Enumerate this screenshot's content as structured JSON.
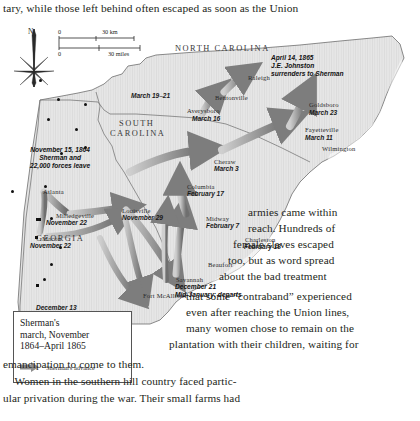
{
  "page": {
    "top_text": "tary, while those left behind often escaped as soon as the Union"
  },
  "body_text": {
    "wrapped_lines": [
      "armies came within",
      "reach. Hundreds of",
      "female slaves escaped",
      "too, but as word spread",
      "about the bad treatment",
      "that some “contraband” experienced",
      "even after reaching the Union lines,",
      "many women chose to remain on the",
      "plantation with their children, waiting for"
    ],
    "full_lines": [
      "emancipation to come to them.",
      "    Women in the southern hill country faced partic-",
      "ular privation during the war. Their small farms had"
    ]
  },
  "map": {
    "compass": {
      "north_letter": "N",
      "icon": "compass-rose-icon"
    },
    "scale": {
      "km_zero": "0",
      "km_label": "30 km",
      "miles_zero": "0",
      "miles_label": "30 miles"
    },
    "states": [
      {
        "name": "NORTH CAROLINA",
        "x": 175,
        "y": 22
      },
      {
        "name": "SOUTH",
        "x": 119,
        "y": 97
      },
      {
        "name": "CAROLINA",
        "x": 110,
        "y": 107
      },
      {
        "name": "GEORGIA",
        "x": 36,
        "y": 212
      }
    ],
    "cities": [
      {
        "label": "Raleigh",
        "x": 248,
        "y": 52,
        "dx": 39,
        "dy": 57,
        "shape": "dot"
      },
      {
        "label": "Bentonville",
        "x": 215,
        "y": 72,
        "dx": 57,
        "dy": 76,
        "shape": "dot"
      },
      {
        "label": "Averysboro",
        "x": 187,
        "y": 85,
        "dx": 47,
        "dy": 96,
        "shape": "dot"
      },
      {
        "label": "Goldsboro",
        "x": 309,
        "y": 79,
        "dx": 84,
        "dy": 81,
        "shape": "dot"
      },
      {
        "label": "Fayetteville",
        "x": 305,
        "y": 104,
        "dx": 75,
        "dy": 106,
        "shape": "dot"
      },
      {
        "label": "Wilmington",
        "x": 322,
        "y": 123,
        "dx": 84,
        "dy": 124,
        "shape": "dot"
      },
      {
        "label": "Cheraw",
        "x": 214,
        "y": 136,
        "dx": 60,
        "dy": 130,
        "shape": "dot"
      },
      {
        "label": "Columbia",
        "x": 187,
        "y": 161,
        "dx": 44,
        "dy": 163,
        "shape": "dot"
      },
      {
        "label": "Louisville",
        "x": 122,
        "y": 185,
        "dx": 36,
        "dy": 196,
        "shape": "square"
      },
      {
        "label": "Midway",
        "x": 206,
        "y": 193,
        "dx": 50,
        "dy": 195,
        "shape": "dot"
      },
      {
        "label": "Charleston",
        "x": 245,
        "y": 214,
        "dx": 59,
        "dy": 224,
        "shape": "dot"
      },
      {
        "label": "Beaufort",
        "x": 208,
        "y": 239,
        "dx": 50,
        "dy": 241,
        "shape": "dot"
      },
      {
        "label": "Savannah",
        "x": 176,
        "y": 254,
        "dx": 43,
        "dy": 256,
        "shape": "dot"
      },
      {
        "label": "Fort McAllister",
        "x": 143,
        "y": 270,
        "dx": 36,
        "dy": 262,
        "shape": "square"
      },
      {
        "label": "Atlanta",
        "x": 43,
        "y": 166,
        "dx": 11,
        "dy": 168,
        "shape": "dot"
      },
      {
        "label": "Milledgeville",
        "x": 56,
        "y": 190,
        "dx": 38,
        "dy": 196,
        "shape": "square"
      },
      {
        "label": "Macon",
        "x": 42,
        "y": 213,
        "dx": 35,
        "dy": 214,
        "shape": "square"
      }
    ],
    "date_labels": [
      {
        "text": "March 19–21",
        "x": 131,
        "y": 70
      },
      {
        "text": "March 16",
        "x": 192,
        "y": 93
      },
      {
        "text": "March 23",
        "x": 309,
        "y": 87
      },
      {
        "text": "March 11",
        "x": 305,
        "y": 112
      },
      {
        "text": "March 3",
        "x": 214,
        "y": 143
      },
      {
        "text": "February 17",
        "x": 187,
        "y": 168
      },
      {
        "text": "February 7",
        "x": 206,
        "y": 200
      },
      {
        "text": "February 18",
        "x": 244,
        "y": 221
      },
      {
        "text": "November 29",
        "x": 122,
        "y": 192
      },
      {
        "text": "November 22",
        "x": 46,
        "y": 197
      },
      {
        "text": "November 22",
        "x": 30,
        "y": 220
      },
      {
        "text": "December 13",
        "x": 36,
        "y": 282
      }
    ],
    "annotations": [
      {
        "id": "johnston-surrender",
        "lines": [
          "April 14, 1865",
          "J.E. Johnston",
          "surrenders to Sherman"
        ],
        "x": 271,
        "y": 32,
        "align": "left"
      },
      {
        "id": "sherman-departure",
        "lines": [
          "November 15, 1864",
          "Sherman and",
          "22,000 forces leave"
        ],
        "x": 30,
        "y": 124,
        "align": "center"
      },
      {
        "id": "savannah-dates",
        "lines": [
          "December 21",
          "Mid-January: departs"
        ],
        "x": 175,
        "y": 261,
        "align": "left"
      }
    ]
  },
  "legend": {
    "title_lines": [
      "Sherman's",
      "march, November",
      "1864–April 1865"
    ],
    "key_icon": "arrow-right-icon",
    "key_label": "Sherman's advance"
  },
  "colors": {
    "land": "#e3e3e3",
    "land_stroke": "#6b6b6b",
    "ocean": "#ffffff",
    "arrow": "#8a8a8a",
    "text": "#231f20"
  }
}
